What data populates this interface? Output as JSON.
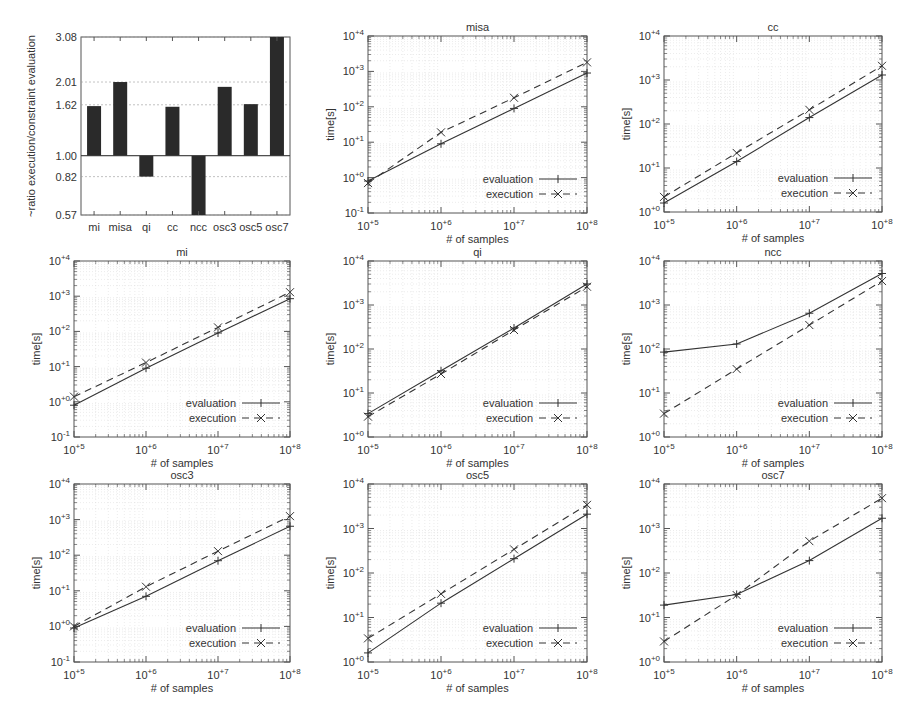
{
  "chart_data": [
    {
      "type": "bar",
      "title": "",
      "ylabel": "~ratio execution/constraint evaluation",
      "xlabel": "",
      "categories": [
        "mi",
        "misa",
        "qi",
        "cc",
        "ncc",
        "osc3",
        "osc5",
        "osc7"
      ],
      "values": [
        1.6,
        2.01,
        0.82,
        1.59,
        0.57,
        1.92,
        1.63,
        3.08
      ],
      "baseline": 1.0,
      "yscale": "log",
      "yticks": [
        "3.08",
        "2.01",
        "1.62",
        "1.00",
        "0.82",
        "0.57"
      ],
      "ylim": [
        0.57,
        3.08
      ],
      "grid": true
    },
    {
      "type": "line",
      "title": "misa",
      "xlabel": "# of samples",
      "ylabel": "time[s]",
      "xscale": "log",
      "yscale": "log",
      "x": [
        "10^+5",
        "10^+6",
        "10^+7",
        "10^+8"
      ],
      "ylim": [
        -1,
        4
      ],
      "series": [
        {
          "name": "evaluation",
          "style": "solid",
          "marker": "+",
          "values": [
            0.8,
            9,
            90,
            900
          ]
        },
        {
          "name": "execution",
          "style": "dashed",
          "marker": "x",
          "values": [
            0.7,
            19,
            180,
            1800
          ]
        }
      ]
    },
    {
      "type": "line",
      "title": "cc",
      "xlabel": "# of samples",
      "ylabel": "time[s]",
      "xscale": "log",
      "yscale": "log",
      "x": [
        "10^+5",
        "10^+6",
        "10^+7",
        "10^+8"
      ],
      "ylim": [
        0,
        4
      ],
      "series": [
        {
          "name": "evaluation",
          "style": "solid",
          "marker": "+",
          "values": [
            1.6,
            14,
            140,
            1300
          ]
        },
        {
          "name": "execution",
          "style": "dashed",
          "marker": "x",
          "values": [
            2.2,
            22,
            210,
            2100
          ]
        }
      ]
    },
    {
      "type": "line",
      "title": "mi",
      "xlabel": "# of samples",
      "ylabel": "time[s]",
      "xscale": "log",
      "yscale": "log",
      "x": [
        "10^+5",
        "10^+6",
        "10^+7",
        "10^+8"
      ],
      "ylim": [
        -1,
        4
      ],
      "series": [
        {
          "name": "evaluation",
          "style": "solid",
          "marker": "+",
          "values": [
            0.8,
            9,
            90,
            850
          ]
        },
        {
          "name": "execution",
          "style": "dashed",
          "marker": "x",
          "values": [
            1.4,
            13,
            130,
            1300
          ]
        }
      ]
    },
    {
      "type": "line",
      "title": "qi",
      "xlabel": "# of samples",
      "ylabel": "time[s]",
      "xscale": "log",
      "yscale": "log",
      "x": [
        "10^+5",
        "10^+6",
        "10^+7",
        "10^+8"
      ],
      "ylim": [
        0,
        4
      ],
      "series": [
        {
          "name": "evaluation",
          "style": "solid",
          "marker": "+",
          "values": [
            3.4,
            32,
            300,
            3000
          ]
        },
        {
          "name": "execution",
          "style": "dashed",
          "marker": "x",
          "values": [
            2.9,
            27,
            270,
            2600
          ]
        }
      ]
    },
    {
      "type": "line",
      "title": "ncc",
      "xlabel": "# of samples",
      "ylabel": "time[s]",
      "xscale": "log",
      "yscale": "log",
      "x": [
        "10^+5",
        "10^+6",
        "10^+7",
        "10^+8"
      ],
      "ylim": [
        0,
        4
      ],
      "series": [
        {
          "name": "evaluation",
          "style": "solid",
          "marker": "+",
          "values": [
            85,
            130,
            650,
            5200
          ]
        },
        {
          "name": "execution",
          "style": "dashed",
          "marker": "x",
          "values": [
            3.4,
            35,
            350,
            3500
          ]
        }
      ]
    },
    {
      "type": "line",
      "title": "osc3",
      "xlabel": "# of samples",
      "ylabel": "time[s]",
      "xscale": "log",
      "yscale": "log",
      "x": [
        "10^+5",
        "10^+6",
        "10^+7",
        "10^+8"
      ],
      "ylim": [
        -1,
        4
      ],
      "series": [
        {
          "name": "evaluation",
          "style": "solid",
          "marker": "+",
          "values": [
            0.9,
            7,
            70,
            650
          ]
        },
        {
          "name": "execution",
          "style": "dashed",
          "marker": "x",
          "values": [
            1.0,
            13,
            130,
            1250
          ]
        }
      ]
    },
    {
      "type": "line",
      "title": "osc5",
      "xlabel": "# of samples",
      "ylabel": "time[s]",
      "xscale": "log",
      "yscale": "log",
      "x": [
        "10^+5",
        "10^+6",
        "10^+7",
        "10^+8"
      ],
      "ylim": [
        0,
        4
      ],
      "series": [
        {
          "name": "evaluation",
          "style": "solid",
          "marker": "+",
          "values": [
            1.6,
            21,
            210,
            2100
          ]
        },
        {
          "name": "execution",
          "style": "dashed",
          "marker": "x",
          "values": [
            3.4,
            34,
            340,
            3400
          ]
        }
      ]
    },
    {
      "type": "line",
      "title": "osc7",
      "xlabel": "# of samples",
      "ylabel": "time[s]",
      "xscale": "log",
      "yscale": "log",
      "x": [
        "10^+5",
        "10^+6",
        "10^+7",
        "10^+8"
      ],
      "ylim": [
        0,
        4
      ],
      "series": [
        {
          "name": "evaluation",
          "style": "solid",
          "marker": "+",
          "values": [
            19,
            33,
            190,
            1700
          ]
        },
        {
          "name": "execution",
          "style": "dashed",
          "marker": "x",
          "values": [
            2.9,
            32,
            520,
            4800
          ]
        }
      ]
    }
  ],
  "layout": {
    "legend": {
      "evaluation": "evaluation",
      "execution": "execution"
    },
    "colors": {
      "bar": "#2a2a2a",
      "line": "#333333",
      "grid": "#d8d8d8",
      "frame": "#555555"
    }
  }
}
